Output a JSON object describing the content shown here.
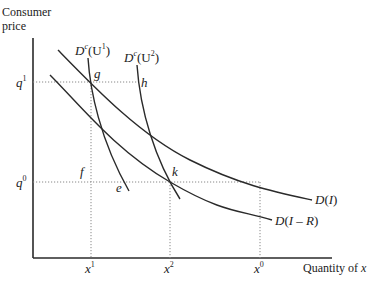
{
  "diagram": {
    "y_axis_label_line1": "Consumer",
    "y_axis_label_line2": "price",
    "x_axis_label": "Quantity of ",
    "x_axis_label_var": "x",
    "price_levels": [
      {
        "base": "q",
        "sup": "1"
      },
      {
        "base": "q",
        "sup": "0"
      }
    ],
    "quantity_levels": [
      {
        "base": "x",
        "sup": "1"
      },
      {
        "base": "x",
        "sup": "2"
      },
      {
        "base": "x",
        "sup": "0"
      }
    ],
    "curves": [
      {
        "id": "D_I",
        "label": "D(I)"
      },
      {
        "id": "D_I_minus_R",
        "label": "D(I – R)"
      },
      {
        "id": "Dc_U1",
        "label_base": "D",
        "label_sup": "c",
        "label_arg": "(U",
        "label_arg_sup": "1",
        "label_close": ")"
      },
      {
        "id": "Dc_U2",
        "label_base": "D",
        "label_sup": "c",
        "label_arg": "(U",
        "label_arg_sup": "2",
        "label_close": ")"
      }
    ],
    "points": {
      "g": "g",
      "h": "h",
      "f": "f",
      "e": "e",
      "k": "k"
    }
  }
}
